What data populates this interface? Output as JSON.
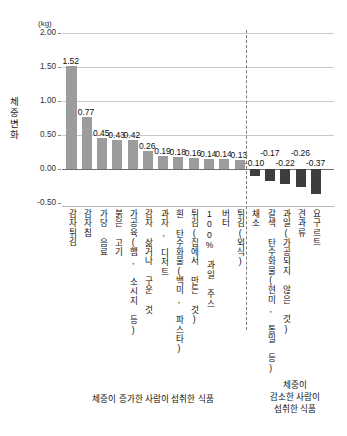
{
  "chart_data": {
    "type": "bar",
    "title": "",
    "subtitle": "",
    "unit_label": "(kg)",
    "ylabel": "체중 변화",
    "xlabel": "",
    "ylim": [
      -0.5,
      2.0
    ],
    "yticks": [
      "2.00",
      "1.50",
      "1.00",
      "0.50",
      "0.00",
      "-0.50"
    ],
    "ytick_values": [
      2.0,
      1.5,
      1.0,
      0.5,
      0.0,
      -0.5
    ],
    "grid": true,
    "legend": "none",
    "zero_line": true,
    "divider_after_index": 11,
    "categories": [
      "감자튀김",
      "감자칩",
      "가당 음료",
      "붉은 고기",
      "가공육(햄, 소시지 등)",
      "감자 삶거나 구운 것",
      "과자, 디저트",
      "흰 탄수화물(백미, 파스타)",
      "튀김(집에서 만든 것)",
      "100% 과일 주스",
      "버터",
      "튀김(외식)",
      "채소",
      "갈색 탄수화물(현미, 통밀 등)",
      "과일(가공되지 않은 것)",
      "견과류",
      "요구르트"
    ],
    "values": [
      1.52,
      0.77,
      0.45,
      0.43,
      0.42,
      0.26,
      0.19,
      0.18,
      0.16,
      0.14,
      0.14,
      0.13,
      -0.1,
      -0.17,
      -0.22,
      -0.26,
      -0.37
    ],
    "value_labels": [
      "1.52",
      "0.77",
      "0.45",
      "0.43",
      "0.42",
      "0.26",
      "0.19",
      "0.18",
      "0.16",
      "0.14",
      "0.14",
      "0.13",
      "-0.10",
      "-0.17",
      "-0.22",
      "-0.26",
      "-0.37"
    ],
    "groups": [
      {
        "name": "체중이 증가한 사람이 섭취한 식품",
        "color": "#9c9c9c",
        "from": 0,
        "to": 11
      },
      {
        "name": "체중이 감소한 사람이 섭취한 식품",
        "color": "#3d3d3d",
        "from": 12,
        "to": 16
      }
    ]
  },
  "captions": {
    "gain": "체중이 증가한 사람이 섭취한 식품",
    "loss": "체중이\n감소한 사람이\n섭취한 식품",
    "loss_line1": "체중이",
    "loss_line2": "감소한 사람이",
    "loss_line3": "섭취한 식품"
  },
  "colors": {
    "positive_bar": "#9c9c9c",
    "negative_bar": "#3d3d3d",
    "gridline": "#c9c9c9",
    "zeroline": "#6e6e6e",
    "divider": "#7a7a7a",
    "text": "#111111"
  }
}
